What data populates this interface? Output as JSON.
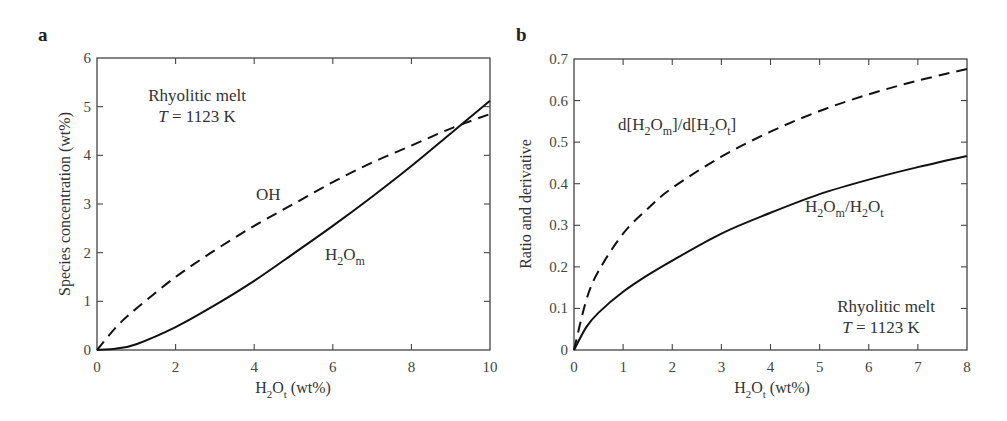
{
  "chart_data": [
    {
      "panel": "a",
      "type": "line",
      "title": "",
      "xlabel": "H2Ot (wt%)",
      "ylabel": "Species concentration (wt%)",
      "xlim": [
        0,
        10
      ],
      "ylim": [
        0,
        6
      ],
      "xticks": [
        0,
        2,
        4,
        6,
        8,
        10
      ],
      "yticks": [
        0,
        1,
        2,
        3,
        4,
        5,
        6
      ],
      "grid": false,
      "annotation": [
        "Rhyolitic melt",
        "T = 1123 K"
      ],
      "series": [
        {
          "name": "OH",
          "style": "dashed",
          "x": [
            0,
            0.5,
            1,
            2,
            3,
            4,
            5,
            6,
            7,
            8,
            9,
            10
          ],
          "y": [
            0,
            0.48,
            0.85,
            1.5,
            2.05,
            2.55,
            3.0,
            3.45,
            3.85,
            4.2,
            4.55,
            4.85
          ]
        },
        {
          "name": "H2Om",
          "style": "solid",
          "x": [
            0,
            0.5,
            1,
            2,
            3,
            4,
            5,
            6,
            7,
            8,
            9,
            10
          ],
          "y": [
            0,
            0.03,
            0.12,
            0.47,
            0.92,
            1.42,
            1.98,
            2.55,
            3.15,
            3.78,
            4.45,
            5.12
          ]
        }
      ]
    },
    {
      "panel": "b",
      "type": "line",
      "title": "",
      "xlabel": "H2Ot (wt%)",
      "ylabel": "Ratio and derivative",
      "xlim": [
        0,
        8
      ],
      "ylim": [
        0,
        0.7
      ],
      "xticks": [
        0,
        1,
        2,
        3,
        4,
        5,
        6,
        7,
        8
      ],
      "yticks": [
        0,
        0.1,
        0.2,
        0.3,
        0.4,
        0.5,
        0.6,
        0.7
      ],
      "grid": false,
      "annotation": [
        "Rhyolitic melt",
        "T = 1123 K"
      ],
      "series": [
        {
          "name": "d[H2Om]/d[H2Ot]",
          "style": "dashed",
          "x": [
            0,
            0.25,
            0.5,
            1,
            1.5,
            2,
            3,
            4,
            5,
            6,
            7,
            8
          ],
          "y": [
            0,
            0.12,
            0.19,
            0.28,
            0.34,
            0.39,
            0.465,
            0.525,
            0.575,
            0.615,
            0.648,
            0.676
          ]
        },
        {
          "name": "H2Om/H2Ot",
          "style": "solid",
          "x": [
            0,
            0.25,
            0.5,
            1,
            1.5,
            2,
            3,
            4,
            5,
            6,
            7,
            8
          ],
          "y": [
            0,
            0.055,
            0.09,
            0.14,
            0.18,
            0.215,
            0.28,
            0.33,
            0.375,
            0.41,
            0.44,
            0.467
          ]
        }
      ]
    }
  ],
  "labels": {
    "panel_a": "a",
    "panel_b": "b",
    "a_xlabel_main": "H",
    "a_xlabel_sub1": "2",
    "a_xlabel_mid": "O",
    "a_xlabel_sub2": "t",
    "a_xlabel_tail": " (wt%)",
    "a_ylabel": "Species concentration (wt%)",
    "b_ylabel": "Ratio and derivative",
    "annot_line1": "Rhyolitic melt",
    "annot_T": "T",
    "annot_line2_tail": " = 1123 K",
    "oh_label": "OH",
    "h2om_H": "H",
    "h2om_2": "2",
    "h2om_O": "O",
    "h2om_m": "m",
    "deriv_d1": "d[H",
    "deriv_2a": "2",
    "deriv_O1": "O",
    "deriv_m": "m",
    "deriv_mid": "]/d[H",
    "deriv_2b": "2",
    "deriv_O2": "O",
    "deriv_t": "t",
    "deriv_end": "]",
    "ratio_H1": "H",
    "ratio_2a": "2",
    "ratio_O1": "O",
    "ratio_m": "m",
    "ratio_slash": "/H",
    "ratio_2b": "2",
    "ratio_O2": "O",
    "ratio_t": "t"
  }
}
